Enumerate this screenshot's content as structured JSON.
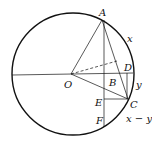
{
  "diagram": {
    "labels": {
      "A": "A",
      "O": "O",
      "B": "B",
      "C": "C",
      "D": "D",
      "E": "E",
      "F": "F",
      "arc_x": "x",
      "arc_y": "y",
      "arc_x_minus_y": "x − y"
    },
    "colors": {
      "stroke": "#111111",
      "background": "#ffffff"
    }
  }
}
